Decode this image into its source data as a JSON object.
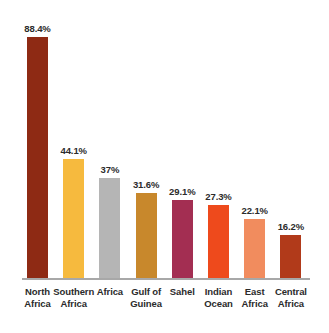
{
  "chart_data": {
    "type": "bar",
    "title": "",
    "subtitle": "",
    "xlabel": "",
    "ylabel": "",
    "ylim": [
      0,
      100
    ],
    "grid": false,
    "legend": "none",
    "axis_baseline_color": "#a8a8a8",
    "background": "#ffffff",
    "categories": [
      "North Africa",
      "Southern Africa",
      "Africa",
      "Gulf of Guinea",
      "Sahel",
      "Indian Ocean",
      "East Africa",
      "Central Africa"
    ],
    "category_lines": [
      [
        "North",
        "Africa"
      ],
      [
        "Southern",
        "Africa"
      ],
      [
        "Africa"
      ],
      [
        "Gulf of",
        "Guinea"
      ],
      [
        "Sahel"
      ],
      [
        "Indian",
        "Ocean"
      ],
      [
        "East",
        "Africa"
      ],
      [
        "Central",
        "Africa"
      ]
    ],
    "values": [
      88.4,
      44.1,
      37,
      31.6,
      29.1,
      27.3,
      22.1,
      16.2
    ],
    "value_labels": [
      "88.4%",
      "44.1%",
      "37%",
      "31.6%",
      "29.1%",
      "27.3%",
      "22.1%",
      "16.2%"
    ],
    "colors": [
      "#8e2a14",
      "#f6ba3e",
      "#b5b5b5",
      "#c8882c",
      "#a32e52",
      "#ee4a1c",
      "#f18c5e",
      "#b13a1a"
    ],
    "bars": [
      {
        "label": "North Africa",
        "value": 88.4,
        "value_label": "88.4%",
        "color": "#8e2a14"
      },
      {
        "label": "Southern Africa",
        "value": 44.1,
        "value_label": "44.1%",
        "color": "#f6ba3e"
      },
      {
        "label": "Africa",
        "value": 37,
        "value_label": "37%",
        "color": "#b5b5b5"
      },
      {
        "label": "Gulf of Guinea",
        "value": 31.6,
        "value_label": "31.6%",
        "color": "#c8882c"
      },
      {
        "label": "Sahel",
        "value": 29.1,
        "value_label": "29.1%",
        "color": "#a32e52"
      },
      {
        "label": "Indian Ocean",
        "value": 27.3,
        "value_label": "27.3%",
        "color": "#ee4a1c"
      },
      {
        "label": "East Africa",
        "value": 22.1,
        "value_label": "22.1%",
        "color": "#f18c5e"
      },
      {
        "label": "Central Africa",
        "value": 16.2,
        "value_label": "16.2%",
        "color": "#b13a1a"
      }
    ]
  }
}
